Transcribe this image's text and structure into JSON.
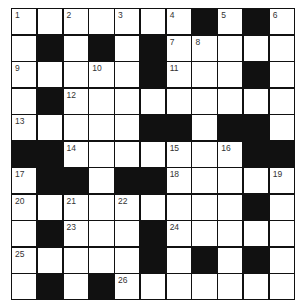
{
  "puzzle": {
    "type": "crossword",
    "rows": 11,
    "cols": 11,
    "colors": {
      "block": "#111111",
      "cell": "#ffffff",
      "number": "#333333"
    },
    "grid": [
      "..... ..#.#.",
      "x"
    ],
    "layout": [
      [
        1,
        0,
        2,
        0,
        3,
        0,
        4,
        -1,
        5,
        -1,
        6
      ],
      [
        0,
        -1,
        0,
        -1,
        0,
        -1,
        7,
        8,
        0,
        0,
        0
      ],
      [
        9,
        0,
        0,
        10,
        0,
        -1,
        11,
        0,
        0,
        -1,
        0
      ],
      [
        0,
        -1,
        12,
        0,
        0,
        0,
        0,
        0,
        0,
        0,
        0
      ],
      [
        13,
        0,
        0,
        0,
        0,
        -1,
        -1,
        0,
        -1,
        -1,
        0
      ],
      [
        -1,
        -1,
        14,
        0,
        0,
        0,
        15,
        0,
        16,
        -1,
        -1
      ],
      [
        17,
        -1,
        -1,
        0,
        -1,
        -1,
        18,
        0,
        0,
        0,
        19
      ],
      [
        20,
        0,
        21,
        0,
        22,
        0,
        0,
        0,
        0,
        -1,
        0
      ],
      [
        0,
        -1,
        23,
        0,
        0,
        -1,
        24,
        0,
        0,
        0,
        0
      ],
      [
        25,
        0,
        0,
        0,
        0,
        -1,
        0,
        -1,
        0,
        -1,
        0
      ],
      [
        0,
        -1,
        0,
        -1,
        26,
        0,
        0,
        0,
        0,
        0,
        0
      ]
    ],
    "legend": {
      "-1": "black square",
      "0": "empty white square",
      "n>0": "white square with clue number n"
    },
    "clue_numbers": [
      "1",
      "2",
      "3",
      "4",
      "5",
      "6",
      "7",
      "8",
      "9",
      "10",
      "11",
      "12",
      "13",
      "14",
      "15",
      "16",
      "17",
      "18",
      "19",
      "20",
      "21",
      "22",
      "23",
      "24",
      "25",
      "26"
    ]
  }
}
